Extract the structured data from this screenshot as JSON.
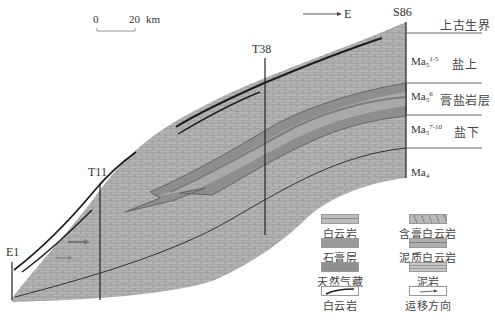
{
  "scale_bar": {
    "start": "0",
    "end": "20",
    "unit": "km"
  },
  "direction": {
    "label": "E"
  },
  "wells": [
    {
      "name": "E1"
    },
    {
      "name": "T11"
    },
    {
      "name": "T38"
    },
    {
      "name": "S86"
    }
  ],
  "strata": [
    {
      "unit": "",
      "label": "上古生界"
    },
    {
      "unit": "Ma",
      "sub": "5",
      "sup": "1-5",
      "label": "盐上"
    },
    {
      "unit": "Ma",
      "sub": "5",
      "sup": "6",
      "label": "膏盐岩层"
    },
    {
      "unit": "Ma",
      "sub": "5",
      "sup": "7-10",
      "label": "盐下"
    },
    {
      "unit": "Ma",
      "sub": "4",
      "sup": "",
      "label": ""
    }
  ],
  "legend": [
    {
      "label": "白云岩",
      "pattern": "dolomite"
    },
    {
      "label": "含膏白云岩",
      "pattern": "gypsum-dolomite"
    },
    {
      "label": "石膏层",
      "pattern": "gypsum"
    },
    {
      "label": "泥质白云岩",
      "pattern": "argillaceous-dolomite"
    },
    {
      "label": "天然气藏",
      "pattern": "gas-reservoir"
    },
    {
      "label": "泥岩",
      "pattern": "mudstone"
    },
    {
      "label": "白云岩",
      "pattern": "dolomite-line"
    },
    {
      "label": "运移方向",
      "pattern": "migration-arrow"
    }
  ],
  "colors": {
    "rock_fill": "#b4b4b4",
    "brick_line": "#8a8a8a",
    "band_dark": "#8c8c8c",
    "band_light": "#a8a8a8",
    "outline": "#222222"
  }
}
